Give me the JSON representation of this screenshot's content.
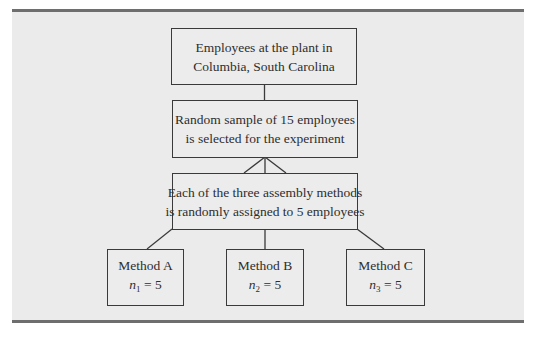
{
  "diagram": {
    "type": "experimental-design-flowchart",
    "colors": {
      "panel_background": "#ebebeb",
      "rule_bars": "#6e6e6e",
      "box_border": "#3a3a3a",
      "text": "#2e2e2e",
      "page_background": "#ffffff"
    },
    "population": {
      "line1": "Employees at the plant in",
      "line2": "Columbia, South Carolina"
    },
    "sample": {
      "line1": "Random sample of 15 employees",
      "line2": "is selected for the experiment"
    },
    "assignment": {
      "line1": "Each of the three assembly methods",
      "line2": "is randomly assigned to 5 employees"
    },
    "methods": [
      {
        "label": "Method A",
        "n_symbol": "n",
        "n_sub": "1",
        "n_eq": " = 5"
      },
      {
        "label": "Method B",
        "n_symbol": "n",
        "n_sub": "2",
        "n_eq": " = 5"
      },
      {
        "label": "Method C",
        "n_symbol": "n",
        "n_sub": "3",
        "n_eq": " = 5"
      }
    ]
  }
}
